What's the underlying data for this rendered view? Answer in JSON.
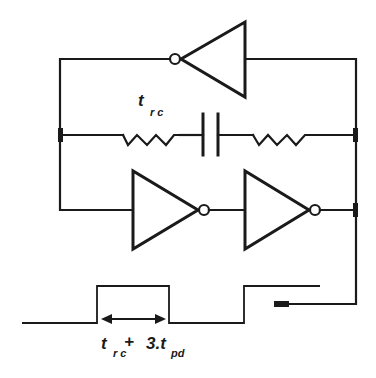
{
  "diagram": {
    "colors": {
      "ink": "#1a1a1a",
      "background": "#ffffff"
    },
    "components": {
      "inverter_top": {
        "type": "inverter",
        "direction": "right-to-left"
      },
      "inverter_bottom_1": {
        "type": "inverter",
        "direction": "left-to-right"
      },
      "inverter_bottom_2": {
        "type": "inverter",
        "direction": "left-to-right"
      },
      "resistor_left": {
        "type": "resistor"
      },
      "capacitor": {
        "type": "capacitor"
      },
      "resistor_right": {
        "type": "resistor"
      },
      "output_terminal": {
        "type": "terminal"
      }
    },
    "labels": {
      "rc_label": {
        "main": "t",
        "sub": "r c"
      },
      "period_label": {
        "part1_main": "t",
        "part1_sub": "r c",
        "plus": "+",
        "part2_main": "3.t",
        "part2_sub": "pd"
      }
    },
    "waveform": {
      "type": "square-pulse",
      "annotation": "double-headed arrow spanning high pulse width"
    }
  }
}
